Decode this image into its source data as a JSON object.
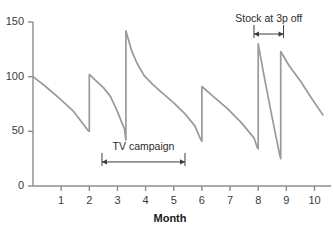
{
  "chart_data": {
    "type": "line",
    "title": "",
    "xlabel": "Month",
    "ylabel": "",
    "xlim": [
      0,
      10.4
    ],
    "ylim": [
      0,
      150
    ],
    "grid": false,
    "legend": null,
    "line_color": "#9a9a9a",
    "axis_color": "#8c8c8c",
    "x_ticks": [
      "1",
      "2",
      "3",
      "4",
      "5",
      "6",
      "7",
      "8",
      "9",
      "10"
    ],
    "x_tick_values": [
      1,
      2,
      3,
      4,
      5,
      6,
      7,
      8,
      9,
      10
    ],
    "y_ticks": [
      "0",
      "50",
      "100",
      "150"
    ],
    "y_tick_values": [
      0,
      50,
      100,
      150
    ],
    "series": [
      {
        "name": "Stock level",
        "points": [
          [
            0.0,
            100
          ],
          [
            0.45,
            91
          ],
          [
            0.95,
            80
          ],
          [
            1.45,
            68
          ],
          [
            1.95,
            51
          ],
          [
            2.0,
            50
          ],
          [
            2.0,
            102
          ],
          [
            2.25,
            96
          ],
          [
            2.5,
            90
          ],
          [
            2.75,
            82
          ],
          [
            3.0,
            68
          ],
          [
            3.25,
            52
          ],
          [
            3.3,
            42
          ],
          [
            3.3,
            142
          ],
          [
            3.5,
            124
          ],
          [
            3.7,
            112
          ],
          [
            3.95,
            101
          ],
          [
            4.25,
            93
          ],
          [
            4.6,
            85
          ],
          [
            5.0,
            76
          ],
          [
            5.4,
            66
          ],
          [
            5.75,
            55
          ],
          [
            5.95,
            43
          ],
          [
            6.0,
            41
          ],
          [
            6.0,
            91
          ],
          [
            6.4,
            82
          ],
          [
            6.9,
            71
          ],
          [
            7.4,
            58
          ],
          [
            7.85,
            44
          ],
          [
            7.97,
            35
          ],
          [
            8.0,
            34
          ],
          [
            8.0,
            130
          ],
          [
            8.25,
            95
          ],
          [
            8.5,
            62
          ],
          [
            8.75,
            30
          ],
          [
            8.8,
            25
          ],
          [
            8.8,
            123
          ],
          [
            9.1,
            110
          ],
          [
            9.5,
            96
          ],
          [
            9.9,
            80
          ],
          [
            10.3,
            65
          ]
        ]
      }
    ],
    "annotations": [
      {
        "name": "tv-campaign",
        "label": "TV campaign",
        "x_start": 2.45,
        "x_end": 5.4,
        "y": 22,
        "style": "double-arrow-bracket"
      },
      {
        "name": "stock-at-3p-off",
        "label": "Stock at 3p off",
        "x_start": 7.85,
        "x_end": 8.9,
        "y": 139,
        "style": "double-arrow-bracket"
      }
    ]
  }
}
